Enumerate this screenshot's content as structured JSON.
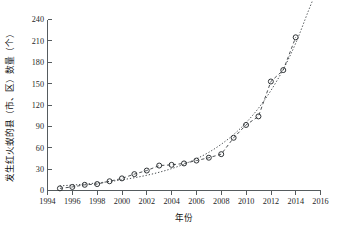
{
  "chart_data": {
    "type": "line",
    "title": "",
    "xlabel": "年份",
    "ylabel": "发生红火蚁的县（市、区）数量（个）",
    "xlim": [
      1994,
      2016
    ],
    "ylim": [
      0,
      240
    ],
    "grid": false,
    "legend": "none",
    "x_ticks": [
      1994,
      1996,
      1998,
      2000,
      2002,
      2004,
      2006,
      2008,
      2010,
      2012,
      2014,
      2016
    ],
    "y_ticks": [
      0,
      30,
      60,
      90,
      120,
      150,
      180,
      210,
      240
    ],
    "x": [
      1995,
      1996,
      1997,
      1998,
      1999,
      2000,
      2001,
      2002,
      2003,
      2004,
      2005,
      2006,
      2007,
      2008,
      2009,
      2010,
      2011,
      2012,
      2013,
      2014
    ],
    "series": [
      {
        "name": "发生红火蚁的县（市、区）数量",
        "marker": "open-circle",
        "linestyle": "dashed",
        "values": [
          3,
          5,
          8,
          9,
          13,
          17,
          23,
          28,
          35,
          36,
          38,
          42,
          46,
          51,
          74,
          92,
          104,
          153,
          169,
          215
        ]
      },
      {
        "name": "拟合曲线",
        "marker": "none",
        "linestyle": "dotted",
        "fit_type": "exponential",
        "values": [
          6.5,
          7.6,
          9.0,
          10.6,
          12.6,
          15.0,
          17.9,
          21.4,
          25.6,
          30.7,
          36.9,
          44.5,
          53.6,
          64.9,
          78.5,
          95.2,
          115.5,
          140.2,
          170.1,
          206.6
        ]
      }
    ],
    "fit_extension_x": [
      2015,
      2015.6
    ],
    "fit_extension_values": [
      251.0,
      277.0
    ]
  },
  "axes": {
    "y_label_text": "发生红火蚁的县（市、区）数量（个）",
    "x_label_text": "年份"
  },
  "colors": {
    "axis": "#555b5e",
    "marker_stroke": "#2f3336",
    "connector": "#43484b",
    "fit": "#3c4145",
    "background": "#ffffff"
  }
}
